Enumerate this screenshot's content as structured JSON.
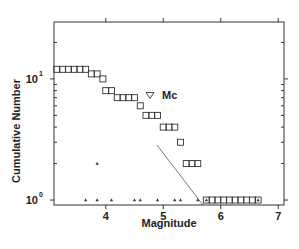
{
  "chart_data": {
    "type": "scatter",
    "title": "",
    "xlabel": "Magnitude",
    "ylabel": "Cumulative Number",
    "xlim": [
      3.1,
      7.1
    ],
    "ylim": [
      0.91,
      29.5
    ],
    "yscale": "log",
    "grid": false,
    "x_ticks": [
      {
        "value": 4,
        "label": "4"
      },
      {
        "value": 5,
        "label": "5"
      },
      {
        "value": 6,
        "label": "6"
      },
      {
        "value": 7,
        "label": "7"
      }
    ],
    "y_ticks": [
      {
        "value": 1,
        "base": "10",
        "exp": "0"
      },
      {
        "value": 10,
        "base": "10",
        "exp": "1"
      }
    ],
    "series": [
      {
        "name": "Cumulative number",
        "marker": "square",
        "points": [
          {
            "x": 3.15,
            "y": 12
          },
          {
            "x": 3.25,
            "y": 12
          },
          {
            "x": 3.35,
            "y": 12
          },
          {
            "x": 3.45,
            "y": 12
          },
          {
            "x": 3.55,
            "y": 12
          },
          {
            "x": 3.65,
            "y": 12
          },
          {
            "x": 3.75,
            "y": 11
          },
          {
            "x": 3.85,
            "y": 11
          },
          {
            "x": 3.95,
            "y": 10
          },
          {
            "x": 4.0,
            "y": 8
          },
          {
            "x": 4.1,
            "y": 8
          },
          {
            "x": 4.2,
            "y": 7
          },
          {
            "x": 4.3,
            "y": 7
          },
          {
            "x": 4.4,
            "y": 7
          },
          {
            "x": 4.5,
            "y": 7
          },
          {
            "x": 4.6,
            "y": 6
          },
          {
            "x": 4.7,
            "y": 5
          },
          {
            "x": 4.8,
            "y": 5
          },
          {
            "x": 4.9,
            "y": 5
          },
          {
            "x": 5.0,
            "y": 4
          },
          {
            "x": 5.1,
            "y": 4
          },
          {
            "x": 5.2,
            "y": 4
          },
          {
            "x": 5.3,
            "y": 3
          },
          {
            "x": 5.4,
            "y": 2
          },
          {
            "x": 5.5,
            "y": 2
          },
          {
            "x": 5.6,
            "y": 2
          },
          {
            "x": 5.75,
            "y": 1
          },
          {
            "x": 5.85,
            "y": 1
          },
          {
            "x": 5.95,
            "y": 1
          },
          {
            "x": 6.05,
            "y": 1
          },
          {
            "x": 6.15,
            "y": 1
          },
          {
            "x": 6.25,
            "y": 1
          },
          {
            "x": 6.35,
            "y": 1
          },
          {
            "x": 6.45,
            "y": 1
          },
          {
            "x": 6.55,
            "y": 1
          },
          {
            "x": 6.65,
            "y": 1
          }
        ]
      },
      {
        "name": "Non-cumulative number",
        "marker": "small-triangle",
        "points": [
          {
            "x": 3.65,
            "y": 1
          },
          {
            "x": 3.85,
            "y": 2
          },
          {
            "x": 3.85,
            "y": 1
          },
          {
            "x": 4.1,
            "y": 1
          },
          {
            "x": 4.5,
            "y": 1
          },
          {
            "x": 4.6,
            "y": 1
          },
          {
            "x": 4.9,
            "y": 1
          },
          {
            "x": 5.2,
            "y": 1
          },
          {
            "x": 5.3,
            "y": 1
          },
          {
            "x": 5.6,
            "y": 1
          },
          {
            "x": 5.75,
            "y": 1
          },
          {
            "x": 6.65,
            "y": 1
          }
        ]
      },
      {
        "name": "Fit line",
        "type": "line",
        "points": [
          {
            "x": 4.89,
            "y": 2.85
          },
          {
            "x": 5.69,
            "y": 0.91
          }
        ]
      }
    ],
    "annotations": [
      {
        "text": "Mc",
        "marker": "open-triangle-down",
        "x": 4.77,
        "y": 7.3
      }
    ]
  }
}
